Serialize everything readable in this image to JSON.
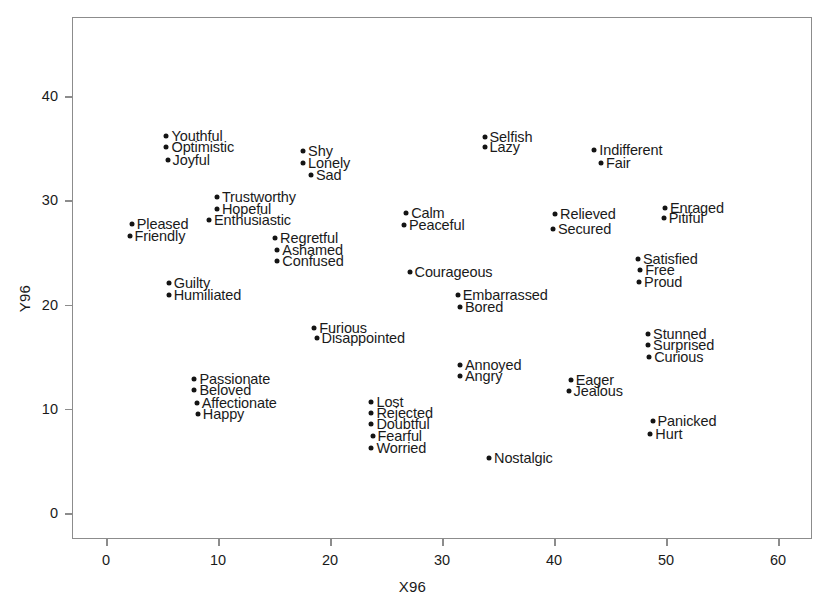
{
  "chart_data": {
    "type": "scatter",
    "title": "",
    "xlabel": "X96",
    "ylabel": "Y96",
    "xlim": [
      -2,
      62.5
    ],
    "ylim": [
      -2.5,
      42.5
    ],
    "xticks": [
      0,
      10,
      20,
      30,
      40,
      50,
      60
    ],
    "yticks": [
      0,
      10,
      20,
      30,
      40
    ],
    "grid": false,
    "legend": null,
    "point_label_position": "right-of-marker",
    "points": [
      {
        "label": "Youthful",
        "x": 5.4,
        "y": 36.2
      },
      {
        "label": "Optimistic",
        "x": 5.4,
        "y": 35.1
      },
      {
        "label": "Joyful",
        "x": 5.5,
        "y": 33.9
      },
      {
        "label": "Shy",
        "x": 17.6,
        "y": 34.7
      },
      {
        "label": "Lonely",
        "x": 17.6,
        "y": 33.6
      },
      {
        "label": "Sad",
        "x": 18.3,
        "y": 32.4
      },
      {
        "label": "Selfish",
        "x": 33.8,
        "y": 36.1
      },
      {
        "label": "Lazy",
        "x": 33.8,
        "y": 35.1
      },
      {
        "label": "Indifferent",
        "x": 43.6,
        "y": 34.8
      },
      {
        "label": "Fair",
        "x": 44.2,
        "y": 33.6
      },
      {
        "label": "Trustworthy",
        "x": 9.9,
        "y": 30.3
      },
      {
        "label": "Hopeful",
        "x": 9.9,
        "y": 29.2
      },
      {
        "label": "Enthusiastic",
        "x": 9.2,
        "y": 28.1
      },
      {
        "label": "Pleased",
        "x": 2.3,
        "y": 27.7
      },
      {
        "label": "Friendly",
        "x": 2.1,
        "y": 26.6
      },
      {
        "label": "Calm",
        "x": 26.8,
        "y": 28.8
      },
      {
        "label": "Peaceful",
        "x": 26.6,
        "y": 27.6
      },
      {
        "label": "Relieved",
        "x": 40.1,
        "y": 28.7
      },
      {
        "label": "Secured",
        "x": 39.9,
        "y": 27.3
      },
      {
        "label": "Enraged",
        "x": 49.9,
        "y": 29.3
      },
      {
        "label": "Pitiful",
        "x": 49.8,
        "y": 28.3
      },
      {
        "label": "Regretful",
        "x": 15.1,
        "y": 26.4
      },
      {
        "label": "Ashamed",
        "x": 15.3,
        "y": 25.2
      },
      {
        "label": "Confused",
        "x": 15.3,
        "y": 24.2
      },
      {
        "label": "Satisfied",
        "x": 47.5,
        "y": 24.4
      },
      {
        "label": "Free",
        "x": 47.7,
        "y": 23.3
      },
      {
        "label": "Proud",
        "x": 47.6,
        "y": 22.2
      },
      {
        "label": "Courageous",
        "x": 27.1,
        "y": 23.1
      },
      {
        "label": "Guilty",
        "x": 5.6,
        "y": 22.1
      },
      {
        "label": "Humiliated",
        "x": 5.6,
        "y": 20.9
      },
      {
        "label": "Embarrassed",
        "x": 31.4,
        "y": 20.9
      },
      {
        "label": "Bored",
        "x": 31.6,
        "y": 19.8
      },
      {
        "label": "Furious",
        "x": 18.6,
        "y": 17.8
      },
      {
        "label": "Disappointed",
        "x": 18.8,
        "y": 16.8
      },
      {
        "label": "Stunned",
        "x": 48.4,
        "y": 17.2
      },
      {
        "label": "Surprised",
        "x": 48.4,
        "y": 16.1
      },
      {
        "label": "Curious",
        "x": 48.5,
        "y": 15.0
      },
      {
        "label": "Annoyed",
        "x": 31.6,
        "y": 14.2
      },
      {
        "label": "Angry",
        "x": 31.6,
        "y": 13.1
      },
      {
        "label": "Eager",
        "x": 41.5,
        "y": 12.8
      },
      {
        "label": "Jealous",
        "x": 41.3,
        "y": 11.7
      },
      {
        "label": "Passionate",
        "x": 7.9,
        "y": 12.9
      },
      {
        "label": "Beloved",
        "x": 7.9,
        "y": 11.8
      },
      {
        "label": "Affectionate",
        "x": 8.1,
        "y": 10.6
      },
      {
        "label": "Happy",
        "x": 8.2,
        "y": 9.5
      },
      {
        "label": "Lost",
        "x": 23.7,
        "y": 10.7
      },
      {
        "label": "Rejected",
        "x": 23.7,
        "y": 9.6
      },
      {
        "label": "Doubtful",
        "x": 23.7,
        "y": 8.5
      },
      {
        "label": "Fearful",
        "x": 23.8,
        "y": 7.4
      },
      {
        "label": "Worried",
        "x": 23.7,
        "y": 6.2
      },
      {
        "label": "Panicked",
        "x": 48.8,
        "y": 8.8
      },
      {
        "label": "Hurt",
        "x": 48.6,
        "y": 7.6
      },
      {
        "label": "Nostalgic",
        "x": 34.2,
        "y": 5.3
      }
    ]
  },
  "colors": {
    "marker": "#141414",
    "text": "#1a1a1a",
    "frame": "#8c8c8c",
    "background": "#ffffff"
  }
}
